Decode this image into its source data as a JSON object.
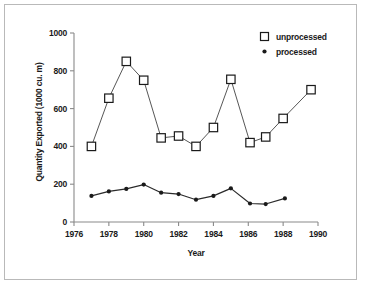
{
  "chart_data": {
    "type": "line",
    "title": "",
    "xlabel": "Year",
    "ylabel": "Quantity Exported (1000 cu. m)",
    "xlim": [
      1976,
      1990
    ],
    "ylim": [
      0,
      1000
    ],
    "xticks": [
      1976,
      1978,
      1980,
      1982,
      1984,
      1986,
      1988,
      1990
    ],
    "yticks": [
      0,
      200,
      400,
      600,
      800,
      1000
    ],
    "grid": false,
    "legend_position": "top-right",
    "series": [
      {
        "name": "unprocessed",
        "marker": "open-square",
        "x": [
          1977.0,
          1978.0,
          1979.0,
          1980.0,
          1981.0,
          1982.0,
          1983.0,
          1984.0,
          1985.0,
          1986.1,
          1987.0,
          1988.0,
          1989.6
        ],
        "values": [
          400,
          655,
          850,
          750,
          445,
          455,
          400,
          500,
          755,
          420,
          450,
          548,
          700
        ]
      },
      {
        "name": "processed",
        "marker": "filled-circle",
        "x": [
          1977.0,
          1978.0,
          1979.0,
          1980.0,
          1981.0,
          1982.0,
          1983.0,
          1984.0,
          1985.0,
          1986.1,
          1987.0,
          1988.1
        ],
        "values": [
          138,
          162,
          175,
          198,
          155,
          148,
          118,
          138,
          178,
          98,
          95,
          125
        ]
      }
    ]
  },
  "axes": {
    "ytick_labels": [
      "1000",
      "800",
      "600",
      "400",
      "200",
      "0"
    ],
    "xtick_labels": [
      "1976",
      "1978",
      "1980",
      "1982",
      "1984",
      "1986",
      "1988",
      "1990"
    ],
    "y_title": "Quantity Exported (1000 cu. m)",
    "x_title": "Year"
  },
  "legend": {
    "items": [
      {
        "label": "unprocessed",
        "marker": "open-square"
      },
      {
        "label": "processed",
        "marker": "filled-circle"
      }
    ]
  },
  "colors": {
    "line": "#2b2b2b",
    "marker_fill": "#ffffff",
    "marker_edge": "#1a1a1a",
    "axis": "#8a8a8a",
    "text": "#1a1a1a",
    "frame": "#b9b9b9",
    "background": "#ffffff"
  }
}
